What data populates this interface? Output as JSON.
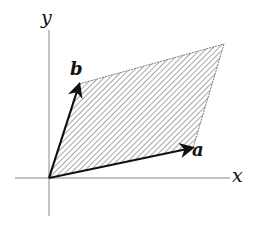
{
  "diagram": {
    "axes": {
      "x_label": "x",
      "y_label": "y"
    },
    "vectors": [
      {
        "name": "a",
        "label": "a"
      },
      {
        "name": "b",
        "label": "b"
      }
    ],
    "region": {
      "fill": "hatched",
      "description": "parallelogram with sides a and b"
    },
    "colors": {
      "axis": "#888888",
      "vector": "#111111",
      "hatch": "#777777",
      "background": "#ffffff"
    }
  }
}
